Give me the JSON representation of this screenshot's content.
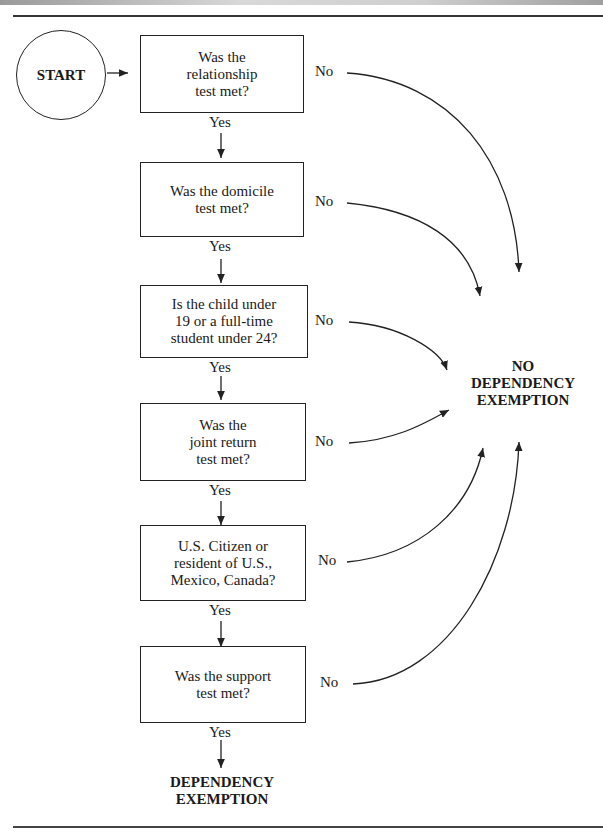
{
  "start": {
    "label": "START"
  },
  "questions": [
    {
      "text": "Was the\nrelationship\ntest met?",
      "yes": "Yes",
      "no": "No"
    },
    {
      "text": "Was the domicile\ntest met?",
      "yes": "Yes",
      "no": "No"
    },
    {
      "text": "Is the child under\n19 or a full-time\nstudent under 24?",
      "yes": "Yes",
      "no": "No"
    },
    {
      "text": "Was the\njoint return\ntest met?",
      "yes": "Yes",
      "no": "No"
    },
    {
      "text": "U.S. Citizen or\nresident of U.S.,\nMexico, Canada?",
      "yes": "Yes",
      "no": "No"
    },
    {
      "text": "Was the support\ntest met?",
      "yes": "Yes",
      "no": "No"
    }
  ],
  "outcomes": {
    "negative": "NO\nDEPENDENCY\nEXEMPTION",
    "positive": "DEPENDENCY\nEXEMPTION"
  }
}
